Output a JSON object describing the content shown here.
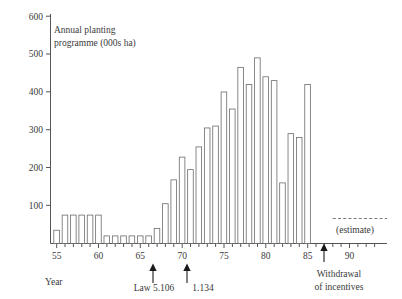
{
  "chart_data": {
    "type": "bar",
    "title": "Annual planting programme (000s ha)",
    "title_line1": "Annual planting",
    "title_line2": "programme (000s ha)",
    "xlabel": "Year",
    "ylabel": "",
    "ylim": [
      0,
      600
    ],
    "xlim": [
      54.2,
      90.5
    ],
    "grid": false,
    "legend": "none",
    "y_ticks": [
      0,
      100,
      200,
      300,
      400,
      500,
      600
    ],
    "y_tick_labels": [
      "",
      "100",
      "200",
      "300",
      "400",
      "500",
      "600"
    ],
    "x_ticks": [
      55,
      60,
      65,
      70,
      75,
      80,
      85,
      90
    ],
    "x_tick_labels": [
      "55",
      "60",
      "65",
      "70",
      "75",
      "80",
      "85",
      "90"
    ],
    "x_minor_tick_interval": 1,
    "categories": [
      55,
      56,
      57,
      58,
      59,
      60,
      61,
      62,
      63,
      64,
      65,
      66,
      67,
      68,
      69,
      70,
      71,
      72,
      73,
      74,
      75,
      76,
      77,
      78,
      79,
      80,
      81,
      82,
      83,
      84,
      85
    ],
    "values": [
      35,
      75,
      75,
      75,
      75,
      75,
      20,
      20,
      20,
      20,
      20,
      20,
      40,
      105,
      168,
      228,
      195,
      255,
      305,
      310,
      400,
      355,
      465,
      420,
      490,
      440,
      430,
      160,
      290,
      280,
      420
    ],
    "units": "000s ha",
    "annotations": [
      {
        "name": "law-5106",
        "label": "Law 5.106",
        "x": 66,
        "type": "arrow-up"
      },
      {
        "name": "law-1134",
        "label": "1.134",
        "x": 70,
        "type": "arrow-up"
      },
      {
        "name": "withdrawal",
        "label_line1": "Withdrawal",
        "label_line2": "of incentives",
        "x": 87,
        "type": "arrow-up"
      },
      {
        "name": "estimate",
        "label": "(estimate)",
        "x_start": 87,
        "x_end": 90.4,
        "y": 65,
        "type": "dashed-line"
      }
    ],
    "colors": {
      "bar_fill": "#ffffff",
      "bar_stroke": "#6b6b6b",
      "axis": "#555555",
      "text": "#3a3a3a",
      "arrow": "#1a1a1a"
    }
  }
}
